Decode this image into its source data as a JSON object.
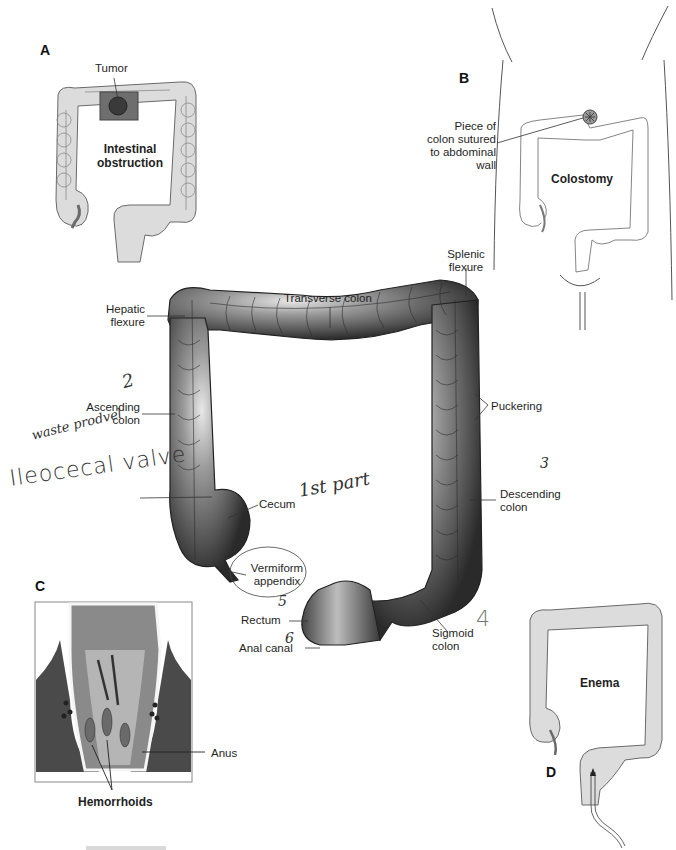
{
  "figure": {
    "panels": {
      "A": {
        "letter": "A",
        "title_line1": "Intestinal",
        "title_line2": "obstruction",
        "callout": "Tumor"
      },
      "B": {
        "letter": "B",
        "title": "Colostomy",
        "callout_line1": "Piece of",
        "callout_line2": "colon sutured",
        "callout_line3": "to abdominal",
        "callout_line4": "wall"
      },
      "C": {
        "letter": "C",
        "callout_hemorrhoids": "Hemorrhoids",
        "callout_anus": "Anus"
      },
      "D": {
        "letter": "D",
        "title": "Enema"
      }
    },
    "main_labels": {
      "hepatic_flexure_1": "Hepatic",
      "hepatic_flexure_2": "flexure",
      "transverse_colon": "Transverse colon",
      "splenic_flexure_1": "Splenic",
      "splenic_flexure_2": "flexure",
      "ascending_colon_1": "Ascending",
      "ascending_colon_2": "colon",
      "puckering": "Puckering",
      "cecum": "Cecum",
      "descending_colon_1": "Descending",
      "descending_colon_2": "colon",
      "vermiform_appendix_1": "Vermiform",
      "vermiform_appendix_2": "appendix",
      "rectum": "Rectum",
      "anal_canal": "Anal canal",
      "sigmoid_colon_1": "Sigmoid",
      "sigmoid_colon_2": "colon"
    },
    "handwritten_notes": {
      "n2": "2",
      "n3": "3",
      "n4": "4",
      "n5": "5",
      "n6": "6",
      "waste": "waste prodvel",
      "ileocecal": "Ileocecal valve",
      "first_part": "1st part"
    }
  }
}
